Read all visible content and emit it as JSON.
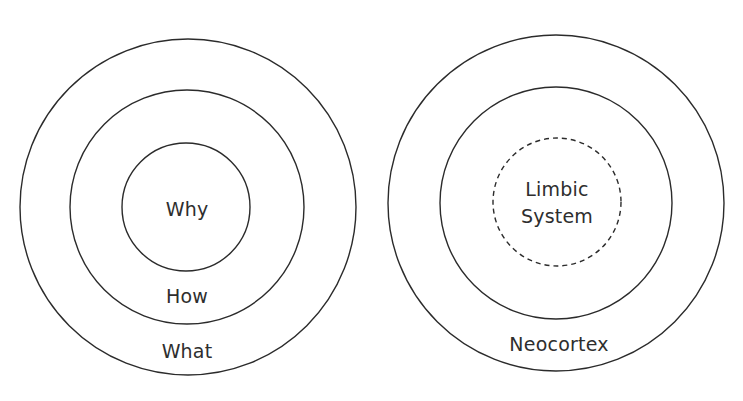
{
  "diagram": {
    "golden_circle": {
      "rings": [
        {
          "name": "outer",
          "cx": 188,
          "cy": 207,
          "r": 168,
          "style": "solid"
        },
        {
          "name": "middle",
          "cx": 187,
          "cy": 207,
          "r": 117,
          "style": "solid"
        },
        {
          "name": "inner",
          "cx": 186,
          "cy": 207,
          "r": 64,
          "style": "solid"
        }
      ],
      "labels": {
        "why": "Why",
        "how": "How",
        "what": "What"
      }
    },
    "brain": {
      "rings": [
        {
          "name": "outer",
          "cx": 556,
          "cy": 203,
          "r": 168,
          "style": "solid"
        },
        {
          "name": "middle",
          "cx": 556,
          "cy": 203,
          "r": 116,
          "style": "solid"
        },
        {
          "name": "inner",
          "cx": 557,
          "cy": 202,
          "r": 64,
          "style": "dashed"
        }
      ],
      "labels": {
        "limbic_line1": "Limbic",
        "limbic_line2": "System",
        "neocortex": "Neocortex"
      }
    },
    "colors": {
      "stroke": "#2b2b2b",
      "text": "#2e2e2e",
      "background": "#ffffff"
    }
  }
}
